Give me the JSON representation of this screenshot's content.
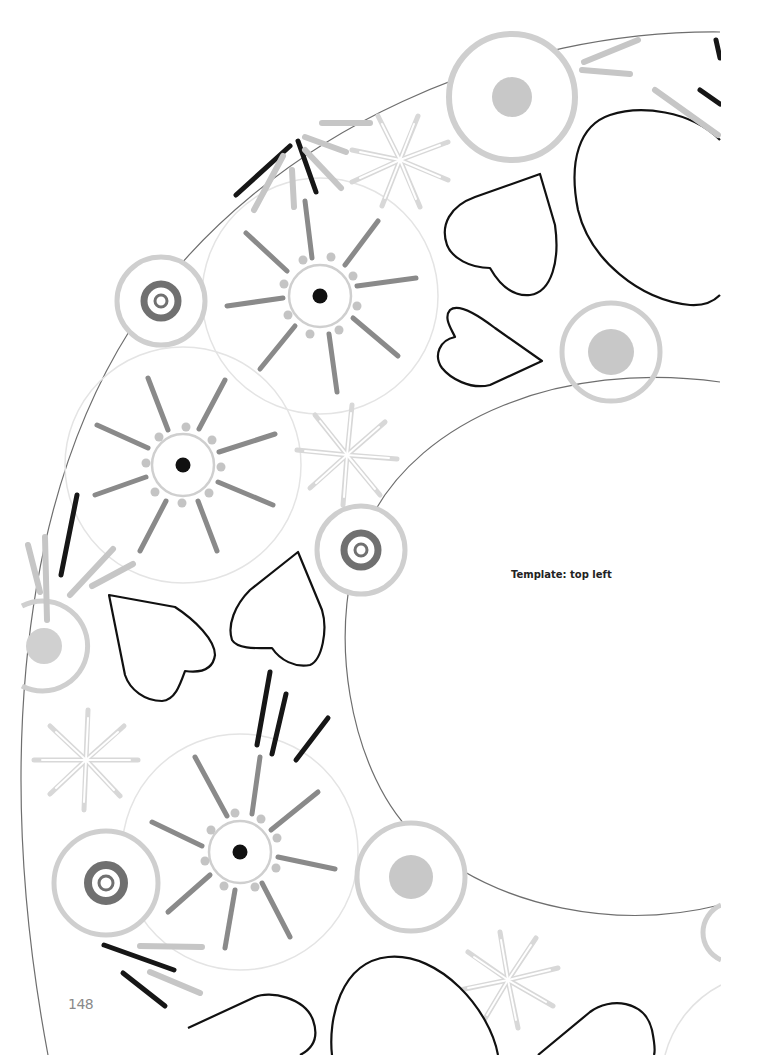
{
  "page": {
    "label": "Template: top left",
    "page_number": "148"
  },
  "colors": {
    "outline": "#111111",
    "dark_gray": "#7a7a7a",
    "mid_gray": "#9a9a9a",
    "light_gray": "#c8c8c8",
    "faint_gray": "#e2e2e2",
    "wreath_line": "#6e6e6e",
    "paper": "#ffffff"
  },
  "wreath": {
    "outer_ring": {
      "cx": 745,
      "cy": 625,
      "r": 700
    },
    "inner_ring": {
      "cx": 745,
      "cy": 625,
      "r": 400
    }
  },
  "sun_flowers": [
    {
      "cx": 320,
      "cy": 296,
      "r_outer": 118,
      "r_inner": 31,
      "dot_r": 7
    },
    {
      "cx": 183,
      "cy": 465,
      "r_outer": 118,
      "r_inner": 31,
      "dot_r": 7
    },
    {
      "cx": 240,
      "cy": 852,
      "r_outer": 118,
      "r_inner": 31,
      "dot_r": 7
    }
  ],
  "target_circles": [
    {
      "cx": 161,
      "cy": 301,
      "r": 45
    },
    {
      "cx": 361,
      "cy": 550,
      "r": 45
    },
    {
      "cx": 104,
      "cy": 883,
      "r": 53
    }
  ],
  "dot_circles": [
    {
      "cx": 512,
      "cy": 97,
      "r": 64,
      "dot_r": 20
    },
    {
      "cx": 611,
      "cy": 352,
      "r": 50,
      "dot_r": 23
    },
    {
      "cx": 411,
      "cy": 877,
      "r": 55,
      "dot_r": 22
    },
    {
      "cx": 45,
      "cy": 646,
      "r": 45,
      "dot_r": 18
    }
  ],
  "sparkles": [
    {
      "cx": 400,
      "cy": 160,
      "r": 50
    },
    {
      "cx": 347,
      "cy": 455,
      "r": 52
    },
    {
      "cx": 85,
      "cy": 760,
      "r": 50
    },
    {
      "cx": 508,
      "cy": 980,
      "r": 52
    }
  ],
  "hearts": [
    {
      "name": "heart-top-right"
    },
    {
      "name": "heart-small-middle"
    },
    {
      "name": "heart-left-lower"
    },
    {
      "name": "heart-right-lower"
    }
  ]
}
